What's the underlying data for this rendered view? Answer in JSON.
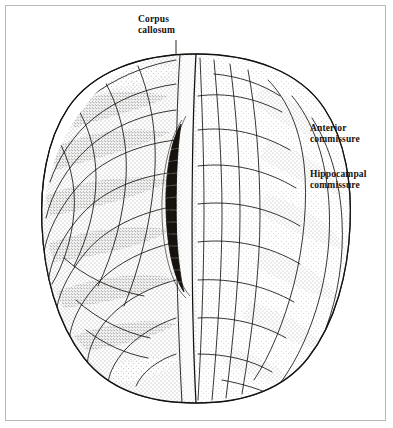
{
  "figure": {
    "kind": "anatomical-illustration",
    "view": "dorsal (superior) view of the human cerebrum",
    "background_color": "#ffffff",
    "ink_color": "#15120f",
    "frame_color": "#b9b9b9"
  },
  "labels": {
    "corpus_callosum": {
      "line1": "Corpus",
      "line2": "callosum"
    },
    "anterior_commissure": {
      "line1": "Anterior",
      "line2": "commissure"
    },
    "hippocampal_commissure": {
      "line1": "Hippocampal",
      "line2": "commissure"
    }
  },
  "structures": {
    "left_hemisphere": "left cerebral hemisphere",
    "right_hemisphere": "right cerebral hemisphere",
    "longitudinal_fissure": "longitudinal fissure",
    "corpus_callosum_body": "corpus callosum",
    "frontal_pole": "frontal pole",
    "occipital_pole": "occipital pole"
  }
}
